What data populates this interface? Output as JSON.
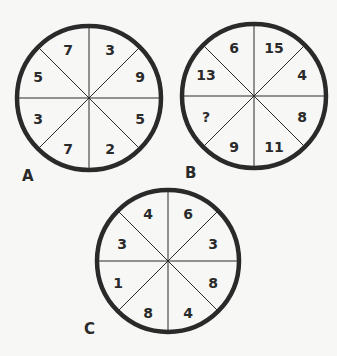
{
  "puzzle": {
    "wheels": [
      {
        "label": "A",
        "center": [
          89,
          98
        ],
        "radius": 72,
        "segments": [
          "7",
          "3",
          "9",
          "5",
          "2",
          "7",
          "3",
          "5"
        ]
      },
      {
        "label": "B",
        "center": [
          254,
          96
        ],
        "radius": 72,
        "segments": [
          "6",
          "15",
          "4",
          "8",
          "11",
          "9",
          "?",
          "13"
        ]
      },
      {
        "label": "C",
        "center": [
          168,
          261
        ],
        "radius": 71,
        "segments": [
          "4",
          "6",
          "3",
          "8",
          "4",
          "8",
          "1",
          "3"
        ]
      }
    ],
    "segment_order": "clockwise starting at top-left segment (top-left, top-right, right-upper, right-lower, bottom-right, bottom-left, left-lower, left-upper)",
    "unknown_marker": "?",
    "colors": {
      "background": "#f7f7f5",
      "ink": "#2a2a2a"
    }
  }
}
